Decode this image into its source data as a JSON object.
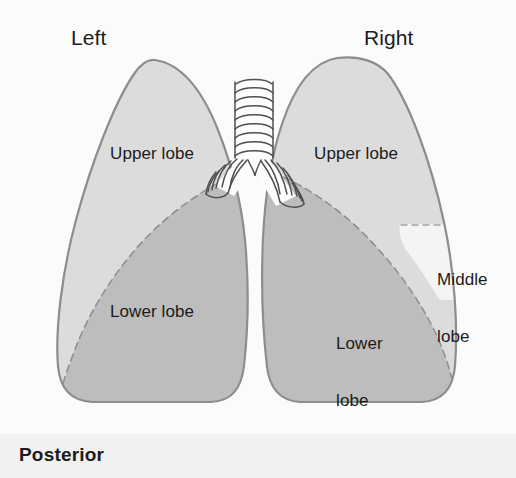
{
  "figure": {
    "background_color": "#fbfbfb",
    "footer_band_color": "#f1f1f1"
  },
  "orientation_labels": {
    "side_left": "Left",
    "side_right": "Right",
    "view": "Posterior"
  },
  "left_lung": {
    "name": "Left lung",
    "lobes": [
      {
        "key": "upper",
        "label": "Upper lobe",
        "fill": "#dcdcdc"
      },
      {
        "key": "lower",
        "label": "Lower lobe",
        "fill": "#bdbdbd"
      }
    ]
  },
  "right_lung": {
    "name": "Right lung",
    "lobes": [
      {
        "key": "upper",
        "label": "Upper lobe",
        "fill": "#dcdcdc"
      },
      {
        "key": "middle",
        "label_line1": "Middle",
        "label_line2": "lobe",
        "fill": "#f4f4f4"
      },
      {
        "key": "lower",
        "label_line1": "Lower",
        "label_line2": "lobe",
        "fill": "#bdbdbd"
      }
    ]
  },
  "airway": {
    "name": "Trachea and main bronchi",
    "fill": "#fdfdfd",
    "stroke": "#4a4a4a"
  },
  "colors": {
    "outline": "#8a8a8a",
    "fissure_dashed": "#9a9a9a",
    "text": "#1b1b1b"
  }
}
